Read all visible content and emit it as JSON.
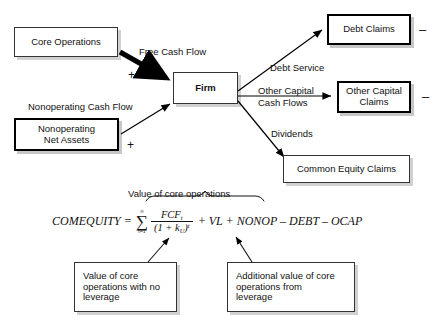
{
  "figure": {
    "faded_header": "",
    "boxes": {
      "core_operations": "Core Operations",
      "nonoperating_net_assets": "Nonoperating\nNet Assets",
      "firm": "Firm",
      "debt_claims": "Debt Claims",
      "other_capital_claims": "Other Capital\nClaims",
      "common_equity_claims": "Common Equity Claims",
      "no_leverage_note": "Value of core operations with no leverage",
      "leverage_note": "Additional value of core operations from leverage"
    },
    "box_lines": {
      "nonoperating_net_assets_1": "Nonoperating",
      "nonoperating_net_assets_2": "Net Assets",
      "other_capital_claims_1": "Other Capital",
      "other_capital_claims_2": "Claims",
      "no_leverage_note_1": "Value of core",
      "no_leverage_note_2": "operations with no",
      "no_leverage_note_3": "leverage",
      "leverage_note_1": "Additional value of core",
      "leverage_note_2": "operations from",
      "leverage_note_3": "leverage"
    },
    "flow_labels": {
      "free_cash_flow": "Free Cash Flow",
      "nonoperating_cash_flow": "Nonoperating Cash Flow",
      "debt_service": "Debt Service",
      "other_capital_cash_flows_1": "Other Capital",
      "other_capital_cash_flows_2": "Cash Flows",
      "dividends": "Dividends"
    },
    "signs": {
      "plus_core": "+",
      "plus_nonoperating": "+",
      "minus_debt": "–",
      "minus_other_capital": "–"
    },
    "brace_caption": "Value of core operations",
    "formula": {
      "lhs": "COMEQUITY",
      "equals": "=",
      "sum_upper": "∞",
      "sum_symbol": "∑",
      "sum_lower": "t=1",
      "numerator": "FCF",
      "numerator_sub": "t",
      "denominator": "(1 + k",
      "denominator_sub": "U",
      "denominator_close": ")",
      "denominator_sup": "t",
      "tail": "+ VL + NONOP – DEBT – OCAP"
    }
  }
}
